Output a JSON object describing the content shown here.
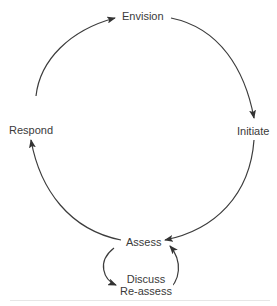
{
  "diagram": {
    "type": "cycle",
    "direction": "clockwise",
    "nodes": [
      {
        "id": "envision",
        "label": "Envision"
      },
      {
        "id": "initiate",
        "label": "Initiate"
      },
      {
        "id": "assess",
        "label": "Assess"
      },
      {
        "id": "discuss_reassess",
        "label_line1": "Discuss",
        "label_line2": "Re-assess"
      },
      {
        "id": "respond",
        "label": "Respond"
      }
    ],
    "edges": [
      {
        "from": "envision",
        "to": "initiate"
      },
      {
        "from": "initiate",
        "to": "assess"
      },
      {
        "from": "assess",
        "to": "discuss_reassess"
      },
      {
        "from": "discuss_reassess",
        "to": "assess"
      },
      {
        "from": "assess",
        "to": "respond"
      },
      {
        "from": "respond",
        "to": "envision"
      }
    ],
    "colors": {
      "line": "#3c3c3c",
      "text": "#3a3a3a",
      "background": "#ffffff"
    }
  }
}
